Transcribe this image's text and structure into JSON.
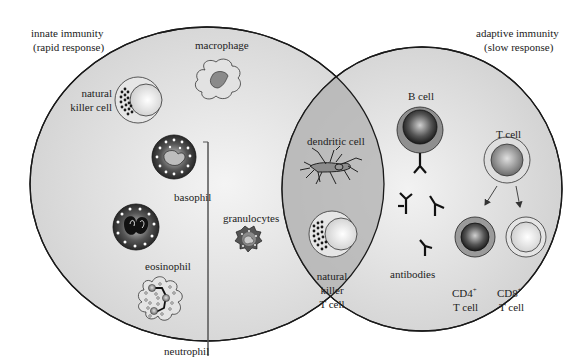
{
  "diagram": {
    "type": "venn",
    "title": "",
    "sets": [
      {
        "name": "innate",
        "label": "innate immunity",
        "sublabel": "(rapid response)"
      },
      {
        "name": "adaptive",
        "label": "adaptive immunity",
        "sublabel": "(slow response)"
      }
    ],
    "innate_only": {
      "cells": [
        {
          "label": "macrophage"
        },
        {
          "label_line1": "natural",
          "label_line2": "killer cell"
        },
        {
          "label": "basophil"
        },
        {
          "label": "eosinophil"
        },
        {
          "label": "neutrophil"
        }
      ],
      "group_bracket_label": "granulocytes"
    },
    "overlap": {
      "cells": [
        {
          "label": "dendritic cell"
        },
        {
          "label_line1": "natural",
          "label_line2": "killer",
          "label_line3": "T cell"
        }
      ]
    },
    "adaptive_only": {
      "cells": [
        {
          "label": "B cell"
        },
        {
          "label": "antibodies"
        },
        {
          "label": "T cell"
        },
        {
          "label_main": "CD4",
          "label_sup": "+",
          "label_line2": "T cell"
        },
        {
          "label_main": "CD8",
          "label_sup": "+",
          "label_line2": "T cell"
        }
      ]
    },
    "colors": {
      "background": "#ffffff",
      "circle_fill": "#d9d9d9",
      "overlap_fill": "#b3b3b3",
      "outline": "#1a1a1a",
      "text": "#222222"
    }
  }
}
